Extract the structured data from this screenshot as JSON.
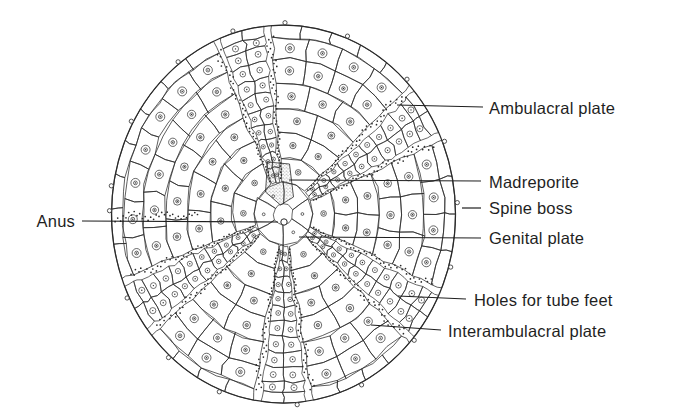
{
  "figure": {
    "illustration": "sea-urchin-test-top-view-diagram",
    "colors": {
      "background": "#ffffff",
      "ink": "#2a2a2a",
      "label_text": "#1f1f1f",
      "stipple": "#707070"
    }
  },
  "labels": [
    {
      "id": "ambulacral-plate",
      "text": "Ambulacral plate",
      "tx": 489,
      "ty": 108,
      "anchor": "left",
      "line": {
        "x1": 397,
        "y1": 105,
        "x2": 483,
        "y2": 107
      }
    },
    {
      "id": "madreporite",
      "text": "Madreporite",
      "tx": 489,
      "ty": 182,
      "anchor": "left",
      "line": {
        "x1": 289,
        "y1": 180,
        "x2": 481,
        "y2": 181
      }
    },
    {
      "id": "spine-boss",
      "text": "Spine boss",
      "tx": 489,
      "ty": 208,
      "anchor": "left",
      "line": {
        "x1": 462,
        "y1": 208,
        "x2": 481,
        "y2": 208
      }
    },
    {
      "id": "genital-plate",
      "text": "Genital plate",
      "tx": 489,
      "ty": 238,
      "anchor": "left",
      "line": {
        "x1": 299,
        "y1": 237,
        "x2": 481,
        "y2": 238
      }
    },
    {
      "id": "holes-for-tube-feet",
      "text": "Holes for tube feet",
      "tx": 474,
      "ty": 300,
      "anchor": "left",
      "line": {
        "x1": 398,
        "y1": 296,
        "x2": 466,
        "y2": 299
      }
    },
    {
      "id": "interambulacral-plate",
      "text": "Interambulacral plate",
      "tx": 448,
      "ty": 331,
      "anchor": "left",
      "line": {
        "x1": 371,
        "y1": 325,
        "x2": 441,
        "y2": 330
      }
    },
    {
      "id": "anus",
      "text": "Anus",
      "tx": 75,
      "ty": 221,
      "anchor": "right",
      "line": {
        "x1": 82,
        "y1": 221,
        "x2": 278,
        "y2": 222
      }
    }
  ]
}
